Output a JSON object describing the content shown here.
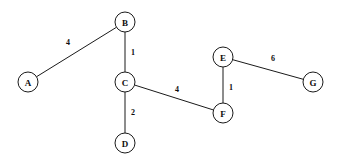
{
  "figure": {
    "type": "undirected-weighted-graph",
    "background_color": "#ffffff",
    "stroke_color": "#1a1a1a",
    "text_color": "#0d0d0d",
    "width": 344,
    "height": 162
  },
  "nodes": [
    {
      "id": "A",
      "label": "A",
      "x": 28,
      "y": 82,
      "r": 10
    },
    {
      "id": "B",
      "label": "B",
      "x": 125,
      "y": 22,
      "r": 10
    },
    {
      "id": "C",
      "label": "C",
      "x": 125,
      "y": 82,
      "r": 10
    },
    {
      "id": "D",
      "label": "D",
      "x": 125,
      "y": 143,
      "r": 10
    },
    {
      "id": "E",
      "label": "E",
      "x": 223,
      "y": 57,
      "r": 10
    },
    {
      "id": "F",
      "label": "F",
      "x": 223,
      "y": 113,
      "r": 10
    },
    {
      "id": "G",
      "label": "G",
      "x": 313,
      "y": 82,
      "r": 10
    }
  ],
  "edges": [
    {
      "id": "A-B",
      "from": "A",
      "to": "B",
      "weight": "4",
      "lx": 68,
      "ly": 42
    },
    {
      "id": "B-C",
      "from": "B",
      "to": "C",
      "weight": "1",
      "lx": 133,
      "ly": 52
    },
    {
      "id": "C-D",
      "from": "C",
      "to": "D",
      "weight": "2",
      "lx": 133,
      "ly": 112
    },
    {
      "id": "C-F",
      "from": "C",
      "to": "F",
      "weight": "4",
      "lx": 177,
      "ly": 89
    },
    {
      "id": "E-F",
      "from": "E",
      "to": "F",
      "weight": "1",
      "lx": 231,
      "ly": 87
    },
    {
      "id": "E-G",
      "from": "E",
      "to": "G",
      "weight": "6",
      "lx": 273,
      "ly": 58
    }
  ]
}
